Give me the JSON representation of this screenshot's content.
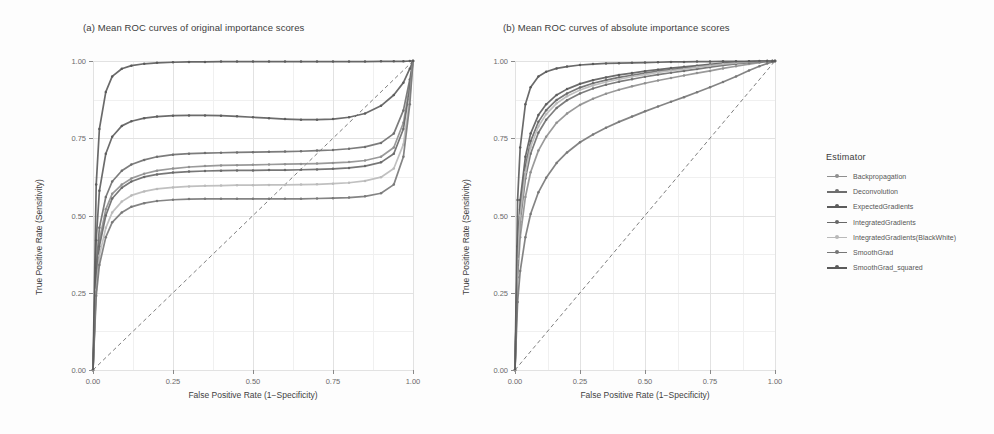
{
  "figure": {
    "background": "#fdfdfd"
  },
  "panels": [
    {
      "id": "a",
      "title": "(a) Mean ROC curves of original importance scores"
    },
    {
      "id": "b",
      "title": "(b) Mean ROC curves of absolute importance scores"
    }
  ],
  "axes": {
    "xlabel": "False Positive Rate (1−Specificity)",
    "ylabel": "True Positive Rate (Sensitivity)",
    "xticks": [
      "0.00",
      "0.25",
      "0.50",
      "0.75",
      "1.00"
    ],
    "yticks": [
      "0.00",
      "0.25",
      "0.50",
      "0.75",
      "1.00"
    ],
    "xlim": [
      0,
      1
    ],
    "ylim": [
      0,
      1
    ]
  },
  "legend": {
    "title": "Estimator",
    "position": "right",
    "items": [
      {
        "label": "Backpropagation",
        "color": "#8f8f8f"
      },
      {
        "label": "Deconvolution",
        "color": "#6e6e6e"
      },
      {
        "label": "ExpectedGradients",
        "color": "#5c5c5c"
      },
      {
        "label": "IntegratedGradients",
        "color": "#686868"
      },
      {
        "label": "IntegratedGradients(BlackWhite)",
        "color": "#b9b9b9"
      },
      {
        "label": "SmoothGrad",
        "color": "#777777"
      },
      {
        "label": "SmoothGrad_squared",
        "color": "#5a5a5a"
      }
    ]
  },
  "chart_data": {
    "type": "line",
    "xlabel": "False Positive Rate (1−Specificity)",
    "ylabel": "True Positive Rate (Sensitivity)",
    "xlim": [
      0,
      1
    ],
    "ylim": [
      0,
      1
    ],
    "grid": true,
    "legend_position": "right",
    "reference_line": {
      "type": "diagonal",
      "style": "dashed",
      "from": [
        0,
        0
      ],
      "to": [
        1,
        1
      ],
      "color": "#555555"
    },
    "panels": [
      {
        "id": "a",
        "title": "(a) Mean ROC curves of original importance scores",
        "x": [
          0.0,
          0.01,
          0.02,
          0.04,
          0.06,
          0.09,
          0.12,
          0.16,
          0.2,
          0.25,
          0.3,
          0.35,
          0.4,
          0.45,
          0.5,
          0.55,
          0.6,
          0.65,
          0.7,
          0.75,
          0.8,
          0.85,
          0.9,
          0.94,
          0.97,
          0.99,
          1.0
        ],
        "series": [
          {
            "name": "Backpropagation",
            "color": "#8f8f8f",
            "values": [
              0.0,
              0.3,
              0.42,
              0.52,
              0.57,
              0.6,
              0.62,
              0.635,
              0.645,
              0.652,
              0.657,
              0.66,
              0.662,
              0.663,
              0.664,
              0.665,
              0.666,
              0.667,
              0.668,
              0.67,
              0.673,
              0.678,
              0.69,
              0.72,
              0.8,
              0.92,
              1.0
            ]
          },
          {
            "name": "Deconvolution",
            "color": "#6e6e6e",
            "values": [
              0.0,
              0.33,
              0.46,
              0.56,
              0.61,
              0.645,
              0.665,
              0.68,
              0.69,
              0.697,
              0.7,
              0.702,
              0.703,
              0.704,
              0.705,
              0.706,
              0.707,
              0.708,
              0.71,
              0.712,
              0.716,
              0.722,
              0.735,
              0.765,
              0.84,
              0.94,
              1.0
            ]
          },
          {
            "name": "ExpectedGradients",
            "color": "#5c5c5c",
            "values": [
              0.0,
              0.42,
              0.58,
              0.7,
              0.755,
              0.79,
              0.805,
              0.815,
              0.82,
              0.823,
              0.824,
              0.824,
              0.823,
              0.821,
              0.818,
              0.815,
              0.812,
              0.81,
              0.81,
              0.812,
              0.818,
              0.83,
              0.855,
              0.89,
              0.93,
              0.975,
              1.0
            ]
          },
          {
            "name": "IntegratedGradients",
            "color": "#686868",
            "values": [
              0.0,
              0.28,
              0.4,
              0.5,
              0.555,
              0.59,
              0.61,
              0.625,
              0.633,
              0.639,
              0.642,
              0.644,
              0.645,
              0.646,
              0.646,
              0.647,
              0.647,
              0.648,
              0.649,
              0.651,
              0.654,
              0.66,
              0.672,
              0.7,
              0.78,
              0.91,
              1.0
            ]
          },
          {
            "name": "IntegratedGradients(BlackWhite)",
            "color": "#b9b9b9",
            "values": [
              0.0,
              0.26,
              0.37,
              0.46,
              0.51,
              0.545,
              0.565,
              0.578,
              0.586,
              0.591,
              0.594,
              0.596,
              0.597,
              0.598,
              0.598,
              0.599,
              0.599,
              0.6,
              0.601,
              0.603,
              0.606,
              0.612,
              0.624,
              0.652,
              0.73,
              0.88,
              1.0
            ]
          },
          {
            "name": "SmoothGrad",
            "color": "#777777",
            "values": [
              0.0,
              0.24,
              0.34,
              0.43,
              0.478,
              0.51,
              0.528,
              0.54,
              0.547,
              0.551,
              0.553,
              0.554,
              0.554,
              0.554,
              0.554,
              0.554,
              0.554,
              0.554,
              0.555,
              0.556,
              0.558,
              0.562,
              0.572,
              0.6,
              0.69,
              0.86,
              1.0
            ]
          },
          {
            "name": "SmoothGrad_squared",
            "color": "#5a5a5a",
            "values": [
              0.0,
              0.6,
              0.78,
              0.9,
              0.95,
              0.975,
              0.985,
              0.991,
              0.994,
              0.996,
              0.997,
              0.997,
              0.998,
              0.998,
              0.998,
              0.998,
              0.998,
              0.998,
              0.998,
              0.998,
              0.998,
              0.998,
              0.999,
              0.999,
              0.999,
              1.0,
              1.0
            ]
          }
        ]
      },
      {
        "id": "b",
        "title": "(b) Mean ROC curves of absolute importance scores",
        "x": [
          0.0,
          0.01,
          0.02,
          0.04,
          0.06,
          0.09,
          0.12,
          0.16,
          0.2,
          0.25,
          0.3,
          0.35,
          0.4,
          0.45,
          0.5,
          0.55,
          0.6,
          0.65,
          0.7,
          0.75,
          0.8,
          0.85,
          0.9,
          0.94,
          0.97,
          0.99,
          1.0
        ],
        "series": [
          {
            "name": "Backpropagation",
            "color": "#8f8f8f",
            "values": [
              0.0,
              0.3,
              0.43,
              0.56,
              0.64,
              0.71,
              0.755,
              0.8,
              0.83,
              0.858,
              0.878,
              0.894,
              0.907,
              0.918,
              0.928,
              0.937,
              0.945,
              0.953,
              0.961,
              0.968,
              0.976,
              0.983,
              0.99,
              0.995,
              0.998,
              0.999,
              1.0
            ]
          },
          {
            "name": "Deconvolution",
            "color": "#6e6e6e",
            "values": [
              0.0,
              0.34,
              0.48,
              0.62,
              0.7,
              0.768,
              0.81,
              0.848,
              0.873,
              0.895,
              0.911,
              0.923,
              0.933,
              0.941,
              0.949,
              0.956,
              0.962,
              0.968,
              0.974,
              0.98,
              0.986,
              0.991,
              0.995,
              0.997,
              0.999,
              1.0,
              1.0
            ]
          },
          {
            "name": "ExpectedGradients",
            "color": "#5c5c5c",
            "values": [
              0.0,
              0.4,
              0.55,
              0.69,
              0.765,
              0.825,
              0.86,
              0.89,
              0.909,
              0.926,
              0.938,
              0.947,
              0.955,
              0.961,
              0.967,
              0.972,
              0.977,
              0.981,
              0.985,
              0.989,
              0.993,
              0.996,
              0.998,
              0.999,
              1.0,
              1.0,
              1.0
            ]
          },
          {
            "name": "IntegratedGradients",
            "color": "#686868",
            "values": [
              0.0,
              0.37,
              0.52,
              0.66,
              0.74,
              0.803,
              0.841,
              0.874,
              0.895,
              0.914,
              0.928,
              0.938,
              0.947,
              0.954,
              0.961,
              0.967,
              0.972,
              0.977,
              0.982,
              0.987,
              0.991,
              0.995,
              0.997,
              0.999,
              1.0,
              1.0,
              1.0
            ]
          },
          {
            "name": "IntegratedGradients(BlackWhite)",
            "color": "#b9b9b9",
            "values": [
              0.0,
              0.36,
              0.5,
              0.64,
              0.722,
              0.788,
              0.828,
              0.863,
              0.886,
              0.906,
              0.921,
              0.932,
              0.941,
              0.949,
              0.956,
              0.963,
              0.969,
              0.974,
              0.98,
              0.985,
              0.99,
              0.994,
              0.997,
              0.999,
              1.0,
              1.0,
              1.0
            ]
          },
          {
            "name": "SmoothGrad",
            "color": "#777777",
            "values": [
              0.0,
              0.22,
              0.32,
              0.43,
              0.505,
              0.575,
              0.622,
              0.67,
              0.704,
              0.737,
              0.762,
              0.784,
              0.803,
              0.82,
              0.837,
              0.853,
              0.868,
              0.883,
              0.899,
              0.915,
              0.932,
              0.95,
              0.969,
              0.983,
              0.992,
              0.997,
              1.0
            ]
          },
          {
            "name": "SmoothGrad_squared",
            "color": "#5a5a5a",
            "values": [
              0.0,
              0.55,
              0.72,
              0.86,
              0.915,
              0.95,
              0.965,
              0.976,
              0.982,
              0.987,
              0.99,
              0.992,
              0.993,
              0.994,
              0.995,
              0.996,
              0.997,
              0.997,
              0.998,
              0.998,
              0.999,
              0.999,
              0.999,
              1.0,
              1.0,
              1.0,
              1.0
            ]
          }
        ]
      }
    ]
  }
}
